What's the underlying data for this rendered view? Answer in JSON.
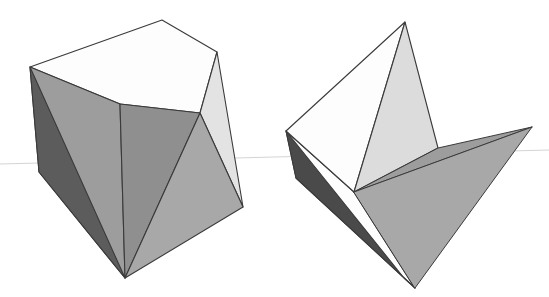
{
  "figure": {
    "background_color": "#ffffff",
    "outline_color": "#3a3a3a",
    "horizon_color": "#cfcfcf",
    "canvas": {
      "width": 549,
      "height": 297
    }
  },
  "palette": {
    "white": "#fdfdfd",
    "near_white": "#f5f5f5",
    "light_gray": "#e3e3e3",
    "pale_gray": "#dcdcdc",
    "mid_gray": "#9d9d9d",
    "mid_gray_2": "#a8a8a8",
    "gray": "#8f8f8f",
    "dark_gray": "#5c5c5c",
    "darkest_gray": "#4a4a4a"
  },
  "horizon": {
    "name": "horizon-line",
    "y_left": 163,
    "y_right": 152,
    "points": "0,164 549,150"
  },
  "left_solid": {
    "name": "closed-polyhedron",
    "faces": [
      {
        "id": "top-face",
        "fill": "#fdfdfd",
        "points": "30,67 162,20 217,52 200,113 120,104"
      },
      {
        "id": "upper-left-face",
        "fill": "#9d9d9d",
        "points": "30,67 120,104 125,278 39,172"
      },
      {
        "id": "left-dark-face",
        "fill": "#5c5c5c",
        "points": "30,67 39,172 125,278"
      },
      {
        "id": "front-face",
        "fill": "#8f8f8f",
        "points": "120,104 200,113 125,278"
      },
      {
        "id": "right-upper-face",
        "fill": "#e3e3e3",
        "points": "200,113 217,52 243,207"
      },
      {
        "id": "right-low-face",
        "fill": "#a8a8a8",
        "points": "200,113 243,207 125,278"
      }
    ]
  },
  "right_solid": {
    "name": "opened-polyhedron",
    "faces": [
      {
        "id": "open-top-white-face",
        "fill": "#fdfdfd",
        "points": "286,131 405,22 354,192"
      },
      {
        "id": "open-blade-face",
        "fill": "#dcdcdc",
        "points": "405,22 438,148 354,192"
      },
      {
        "id": "open-band-upper-face",
        "fill": "#9d9d9d",
        "points": "354,192 438,148 532,127"
      },
      {
        "id": "open-band-lower-face",
        "fill": "#a8a8a8",
        "points": "354,192 532,127 415,288"
      },
      {
        "id": "open-base-white-face",
        "fill": "#fdfdfd",
        "points": "286,131 354,192 415,288 296,178"
      },
      {
        "id": "open-base-dark-face",
        "fill": "#4a4a4a",
        "points": "286,131 296,178 415,288 404,278"
      }
    ]
  }
}
